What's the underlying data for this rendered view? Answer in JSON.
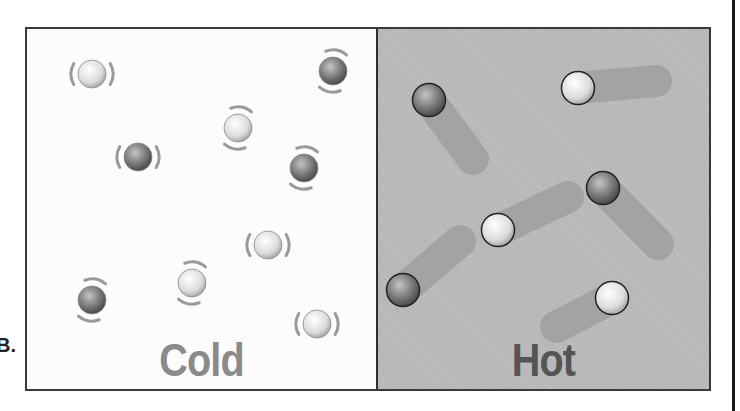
{
  "fragment_text": "B.",
  "panels": {
    "cold": {
      "label": "Cold",
      "background": "#fcfcfc",
      "label_color": "#8a8a8a"
    },
    "hot": {
      "label": "Hot",
      "background": "#bcbcbc",
      "label_color": "#545454"
    }
  },
  "colors": {
    "frame": "#3a3a3a",
    "vibration_arc": "#9a9a9a",
    "particle_light": "#e2e2e2",
    "particle_dark": "#7a7a7a",
    "trail": "#9c9c9c"
  },
  "cold_particles": [
    {
      "x": 65,
      "y": 45,
      "tone": "light",
      "arcs": "sides"
    },
    {
      "x": 306,
      "y": 42,
      "tone": "dark",
      "arcs": "diag"
    },
    {
      "x": 211,
      "y": 99,
      "tone": "light",
      "arcs": "diag"
    },
    {
      "x": 111,
      "y": 128,
      "tone": "dark",
      "arcs": "sides"
    },
    {
      "x": 277,
      "y": 139,
      "tone": "dark",
      "arcs": "diag"
    },
    {
      "x": 241,
      "y": 216,
      "tone": "light",
      "arcs": "sides"
    },
    {
      "x": 165,
      "y": 254,
      "tone": "light",
      "arcs": "diag"
    },
    {
      "x": 65,
      "y": 271,
      "tone": "dark",
      "arcs": "diag"
    },
    {
      "x": 290,
      "y": 295,
      "tone": "light",
      "arcs": "sides"
    }
  ],
  "hot_particles": [
    {
      "x": 51,
      "y": 71,
      "tone": "dark",
      "tx": 95,
      "ty": 130
    },
    {
      "x": 200,
      "y": 59,
      "tone": "light",
      "tx": 278,
      "ty": 52
    },
    {
      "x": 225,
      "y": 159,
      "tone": "dark",
      "tx": 280,
      "ty": 215
    },
    {
      "x": 120,
      "y": 201,
      "tone": "light",
      "tx": 190,
      "ty": 168
    },
    {
      "x": 25,
      "y": 261,
      "tone": "dark",
      "tx": 82,
      "ty": 212
    },
    {
      "x": 234,
      "y": 269,
      "tone": "light",
      "tx": 178,
      "ty": 298
    }
  ]
}
